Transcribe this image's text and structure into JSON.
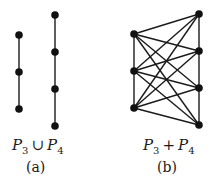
{
  "figure_a": {
    "caption": "(a)",
    "label": {
      "left_base": "P",
      "left_sub": "3",
      "op": "∪",
      "right_base": "P",
      "right_sub": "4"
    },
    "vertices": [
      {
        "x": 19,
        "y": 35
      },
      {
        "x": 19,
        "y": 72
      },
      {
        "x": 19,
        "y": 109
      },
      {
        "x": 55,
        "y": 15
      },
      {
        "x": 55,
        "y": 52
      },
      {
        "x": 55,
        "y": 89
      },
      {
        "x": 55,
        "y": 126
      }
    ],
    "edges": [
      [
        0,
        1
      ],
      [
        1,
        2
      ],
      [
        3,
        4
      ],
      [
        4,
        5
      ],
      [
        5,
        6
      ]
    ]
  },
  "figure_b": {
    "caption": "(b)",
    "label": {
      "left_base": "P",
      "left_sub": "3",
      "op": "+",
      "right_base": "P",
      "right_sub": "4"
    },
    "vertices": [
      {
        "x": 134,
        "y": 34
      },
      {
        "x": 134,
        "y": 71
      },
      {
        "x": 134,
        "y": 108
      },
      {
        "x": 199,
        "y": 14
      },
      {
        "x": 199,
        "y": 51
      },
      {
        "x": 199,
        "y": 88
      },
      {
        "x": 199,
        "y": 125
      }
    ],
    "edges": [
      [
        0,
        1
      ],
      [
        1,
        2
      ],
      [
        3,
        4
      ],
      [
        4,
        5
      ],
      [
        5,
        6
      ],
      [
        0,
        3
      ],
      [
        0,
        4
      ],
      [
        0,
        5
      ],
      [
        0,
        6
      ],
      [
        1,
        3
      ],
      [
        1,
        4
      ],
      [
        1,
        5
      ],
      [
        1,
        6
      ],
      [
        2,
        3
      ],
      [
        2,
        4
      ],
      [
        2,
        5
      ],
      [
        2,
        6
      ]
    ]
  },
  "style": {
    "stroke": "#1a1a1a",
    "vertex_fill": "#111111",
    "vertex_radius": 3.8,
    "stroke_width": 1.4
  }
}
